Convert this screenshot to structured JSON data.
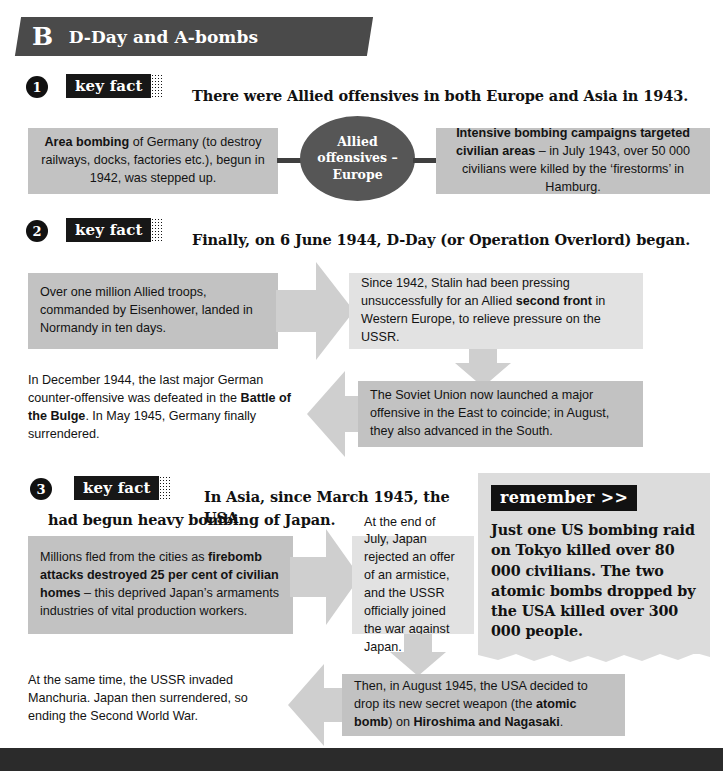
{
  "header": {
    "letter": "B",
    "title": "D-Day and A-bombs"
  },
  "badges": {
    "key_fact": "key fact",
    "remember": "remember >>"
  },
  "bullets": {
    "one": "1",
    "two": "2",
    "three": "3"
  },
  "sections": [
    {
      "number": "1",
      "heading": "There were Allied offensives in both Europe and Asia in 1943.",
      "oval": "Allied offensives – Europe",
      "left_box": "Area bombing of Germany (to destroy railways, docks, factories etc.), begun in 1942, was stepped up.",
      "left_box_bold": "Area bombing",
      "left_box_rest": " of Germany (to destroy railways, docks, factories etc.), begun in 1942, was stepped up.",
      "right_box_bold": "Intensive bombing campaigns targeted civilian areas",
      "right_box_rest": " – in July 1943, over 50 000 civilians were killed by the ‘firestorms’ in Hamburg."
    },
    {
      "number": "2",
      "heading": "Finally, on 6 June 1944, D-Day (or Operation Overlord) began.",
      "box_a": "Over one million Allied troops, commanded by Eisenhower, landed in Normandy in ten days.",
      "box_b_pre": "Since 1942, Stalin had been pressing unsuccessfully for an Allied ",
      "box_b_bold": "second front",
      "box_b_post": " in Western Europe, to relieve pressure on the USSR.",
      "box_c_pre": "In December 1944, the last major German counter-offensive was defeated in the ",
      "box_c_bold": "Battle of the Bulge",
      "box_c_post": ". In May 1945, Germany finally surrendered.",
      "box_d": "The Soviet Union now launched a major offensive in the East to coincide; in August, they also advanced in the South."
    },
    {
      "number": "3",
      "heading_line1": "In Asia, since March 1945, the USA",
      "heading_line2": "had begun heavy bombing of Japan.",
      "box_a_pre": "Millions fled from the cities as ",
      "box_a_bold": "firebomb attacks destroyed 25 per cent of civilian homes",
      "box_a_post": " – this deprived Japan’s armaments industries of vital production workers.",
      "box_b": "At the end of July, Japan rejected an offer of an armistice, and the USSR officially joined the war against Japan.",
      "box_c": "At the same time, the USSR invaded Manchuria. Japan then surrendered, so ending the Second World War.",
      "box_d_pre": "Then, in August 1945, the USA decided to drop its new secret weapon (the ",
      "box_d_bold1": "atomic bomb",
      "box_d_mid": ") on ",
      "box_d_bold2": "Hiroshima and Nagasaki",
      "box_d_post": "."
    }
  ],
  "remember_box": {
    "tag": "remember >>",
    "text": "Just one US bombing raid on Tokyo killed over 80 000 civilians. The two atomic bombs dropped by the USA killed over 300 000 people."
  },
  "colors": {
    "banner": "#4a4a4a",
    "badge": "#171717",
    "box": "#c2c2c2",
    "box_light": "#e2e2e2",
    "oval": "#565656",
    "arrow": "#cfcfcf",
    "footer": "#2b2b2b"
  }
}
